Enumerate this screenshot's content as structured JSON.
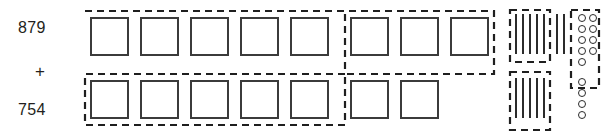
{
  "problem": {
    "addend_top": "879",
    "operator": "+",
    "addend_bottom": "754",
    "type": "base-ten-block-addition"
  },
  "colors": {
    "ink": "#231f20",
    "outline": "#3b3b3b",
    "dashed": "#1f1f1f",
    "background": "#ffffff"
  },
  "blocks": {
    "hundreds_label": "hundreds-flats-squares",
    "tens_label": "tens-rods-lines",
    "ones_label": "ones-units-circles",
    "top_row": {
      "hundreds": 8,
      "tens": 7,
      "ones": 9
    },
    "bottom_row": {
      "hundreds": 7,
      "tens": 5,
      "ones": 4
    }
  },
  "grouping": {
    "hundreds_group_count": 10,
    "tens_group_count": 10,
    "ones_group_count": 10,
    "note": "dashed outlines enclose groups of ten for regrouping"
  },
  "layout": {
    "hundreds": {
      "top": [
        {
          "x": 90,
          "y": 17
        },
        {
          "x": 140,
          "y": 17
        },
        {
          "x": 190,
          "y": 17
        },
        {
          "x": 240,
          "y": 17
        },
        {
          "x": 290,
          "y": 17
        },
        {
          "x": 350,
          "y": 17
        },
        {
          "x": 400,
          "y": 17
        },
        {
          "x": 450,
          "y": 17
        }
      ],
      "bottom": [
        {
          "x": 90,
          "y": 80
        },
        {
          "x": 140,
          "y": 80
        },
        {
          "x": 190,
          "y": 80
        },
        {
          "x": 240,
          "y": 80
        },
        {
          "x": 290,
          "y": 80
        },
        {
          "x": 350,
          "y": 80
        },
        {
          "x": 400,
          "y": 80
        }
      ]
    },
    "tens": {
      "top": [
        {
          "x": 515,
          "y": 14
        },
        {
          "x": 522,
          "y": 14
        },
        {
          "x": 529,
          "y": 14
        },
        {
          "x": 536,
          "y": 14
        },
        {
          "x": 543,
          "y": 14
        },
        {
          "x": 556,
          "y": 14
        },
        {
          "x": 563,
          "y": 14
        }
      ],
      "bottom": [
        {
          "x": 515,
          "y": 78
        },
        {
          "x": 522,
          "y": 78
        },
        {
          "x": 529,
          "y": 78
        },
        {
          "x": 536,
          "y": 78
        },
        {
          "x": 543,
          "y": 78
        }
      ]
    },
    "ones": {
      "top": [
        {
          "x": 578,
          "y": 14
        },
        {
          "x": 589,
          "y": 14
        },
        {
          "x": 578,
          "y": 25
        },
        {
          "x": 589,
          "y": 25
        },
        {
          "x": 578,
          "y": 36
        },
        {
          "x": 589,
          "y": 36
        },
        {
          "x": 578,
          "y": 47
        },
        {
          "x": 589,
          "y": 47
        },
        {
          "x": 578,
          "y": 58
        }
      ],
      "bottom": [
        {
          "x": 578,
          "y": 78
        },
        {
          "x": 578,
          "y": 89
        },
        {
          "x": 578,
          "y": 100
        },
        {
          "x": 578,
          "y": 111
        }
      ]
    },
    "dashed_outlines": {
      "hundreds_group": "M 85,11 L 494,11 L 494,74 L 345,74 L 345,125 L 85,125 L 85,74 L 345,74 L 345,11",
      "tens_group_top": {
        "x": 510,
        "y": 10,
        "w": 40,
        "h": 52
      },
      "tens_group_bottom": {
        "x": 510,
        "y": 72,
        "w": 40,
        "h": 58
      },
      "ones_group": {
        "x": 571,
        "y": 10,
        "w": 28,
        "h": 78
      }
    }
  }
}
